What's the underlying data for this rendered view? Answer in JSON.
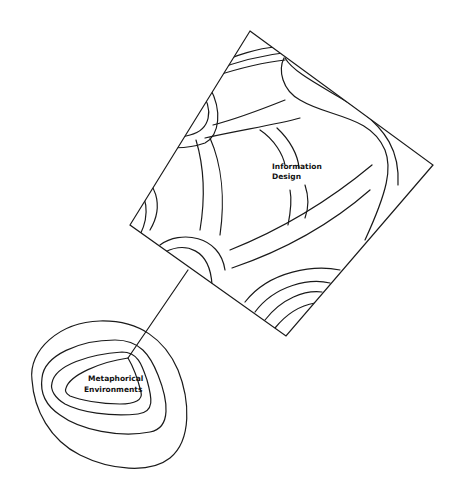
{
  "diagram": {
    "nodes": [
      {
        "id": "information-design",
        "label_lines": [
          "Information",
          "Design"
        ],
        "shape": "diamond-map"
      },
      {
        "id": "metaphorical-environments",
        "label_lines": [
          "Metaphorical",
          "Environments"
        ],
        "shape": "contour-blob"
      }
    ],
    "edges": [
      {
        "from": "metaphorical-environments",
        "to": "information-design",
        "style": "line"
      }
    ]
  },
  "colors": {
    "stroke": "#1a1a1a",
    "background": "#ffffff"
  }
}
